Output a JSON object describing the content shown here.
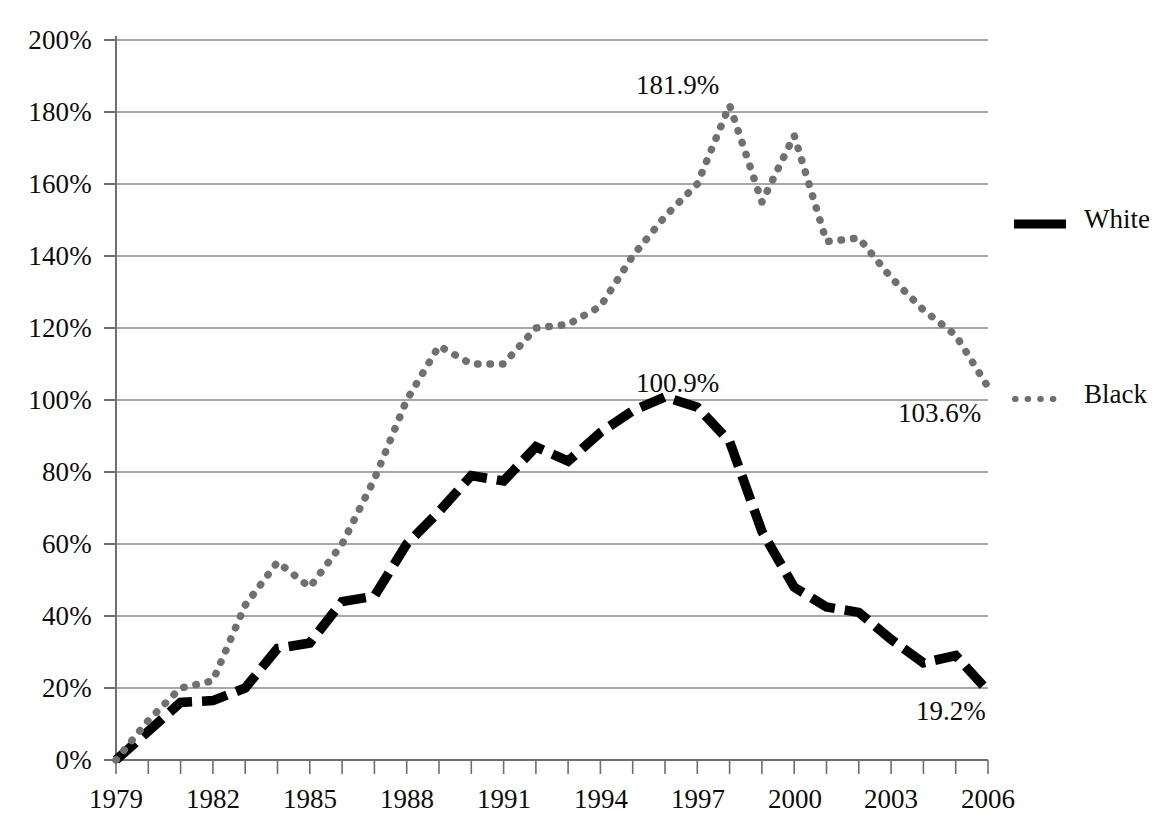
{
  "chart_data": {
    "type": "line",
    "title": "",
    "subtitle": "",
    "xlabel": "",
    "ylabel": "",
    "xlim": [
      1979,
      2006
    ],
    "ylim": [
      0,
      200
    ],
    "grid": true,
    "legend_position": "right",
    "y_ticks": [
      "0%",
      "20%",
      "40%",
      "60%",
      "80%",
      "100%",
      "120%",
      "140%",
      "160%",
      "180%",
      "200%"
    ],
    "y_tick_values": [
      0,
      20,
      40,
      60,
      80,
      100,
      120,
      140,
      160,
      180,
      200
    ],
    "x_ticks": [
      "1979",
      "1982",
      "1985",
      "1988",
      "1991",
      "1994",
      "1997",
      "2000",
      "2003",
      "2006"
    ],
    "x_tick_values": [
      1979,
      1982,
      1985,
      1988,
      1991,
      1994,
      1997,
      2000,
      2003,
      2006
    ],
    "x": [
      1979,
      1980,
      1981,
      1982,
      1983,
      1984,
      1985,
      1986,
      1987,
      1988,
      1989,
      1990,
      1991,
      1992,
      1993,
      1994,
      1995,
      1996,
      1997,
      1998,
      1999,
      2000,
      2001,
      2002,
      2003,
      2004,
      2005,
      2006
    ],
    "series": [
      {
        "name": "White",
        "style": "dashed-thick",
        "color": "#000000",
        "values": [
          0,
          8,
          16,
          16.5,
          20,
          31,
          32.5,
          44,
          45.5,
          60,
          69,
          79,
          77.5,
          87,
          83,
          91,
          97,
          100.9,
          98,
          88.5,
          63.5,
          48,
          42.5,
          41,
          33.5,
          27,
          29,
          19.2
        ]
      },
      {
        "name": "Black",
        "style": "dotted",
        "color": "#707070",
        "values": [
          0,
          11,
          20,
          22,
          43,
          55,
          48,
          60,
          78,
          100,
          115,
          110,
          110,
          120,
          121,
          126,
          140,
          151,
          160,
          181.9,
          155,
          173.5,
          144,
          145,
          134,
          125,
          118,
          103.6
        ]
      }
    ],
    "annotations": [
      {
        "text": "181.9%",
        "series": "Black",
        "x": 1996,
        "y": 181.9
      },
      {
        "text": "100.9%",
        "series": "White",
        "x": 1996,
        "y": 100.9
      },
      {
        "text": "103.6%",
        "series": "Black",
        "x": 2006,
        "y": 103.6
      },
      {
        "text": "19.2%",
        "series": "White",
        "x": 2006,
        "y": 19.2
      }
    ]
  },
  "legend": {
    "items": [
      {
        "label": "White",
        "marker": "solid-line-swatch"
      },
      {
        "label": "Black",
        "marker": "dotted-line-swatch"
      }
    ]
  }
}
